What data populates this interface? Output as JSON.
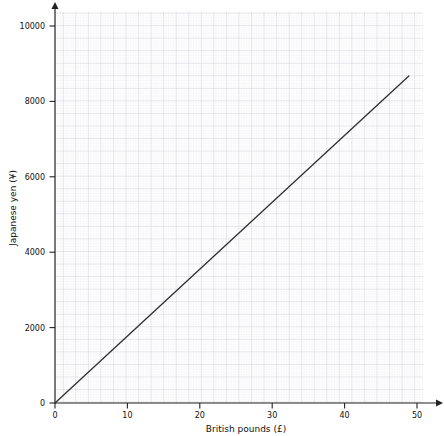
{
  "chart_data": {
    "type": "line",
    "title": "",
    "subtitle": "",
    "xlabel": "British pounds (£)",
    "ylabel": "Japanese yen (¥)",
    "xlim": [
      0,
      52
    ],
    "ylim": [
      0,
      10400
    ],
    "xticks": [
      0,
      10,
      20,
      30,
      40,
      50
    ],
    "xtick_labels": [
      "0",
      "10",
      "20",
      "30",
      "40",
      "50"
    ],
    "yticks": [
      0,
      2000,
      4000,
      6000,
      8000,
      10000
    ],
    "ytick_labels": [
      "0",
      "2000",
      "4000",
      "6000",
      "8000",
      "10000"
    ],
    "grid": true,
    "grid_major_step_x": 1.75,
    "grid_major_step_y": 350,
    "grid_minor_step_x": 0.35,
    "grid_minor_step_y": 70,
    "legend": "none",
    "series": [
      {
        "name": "GBP to JPY conversion",
        "x": [
          0,
          50
        ],
        "values": [
          0,
          8700
        ],
        "color": "#333333",
        "slope_yen_per_pound": 174
      }
    ],
    "colors": {
      "axis": "#222222",
      "line": "#333333",
      "grid_major": "#cfcfd6",
      "grid_minor": "#ebebf0",
      "text": "#111111",
      "background": "#ffffff"
    }
  },
  "axes": {
    "x_axis_name": "British pounds (£)",
    "y_axis_name": "Japanese yen (¥)"
  }
}
